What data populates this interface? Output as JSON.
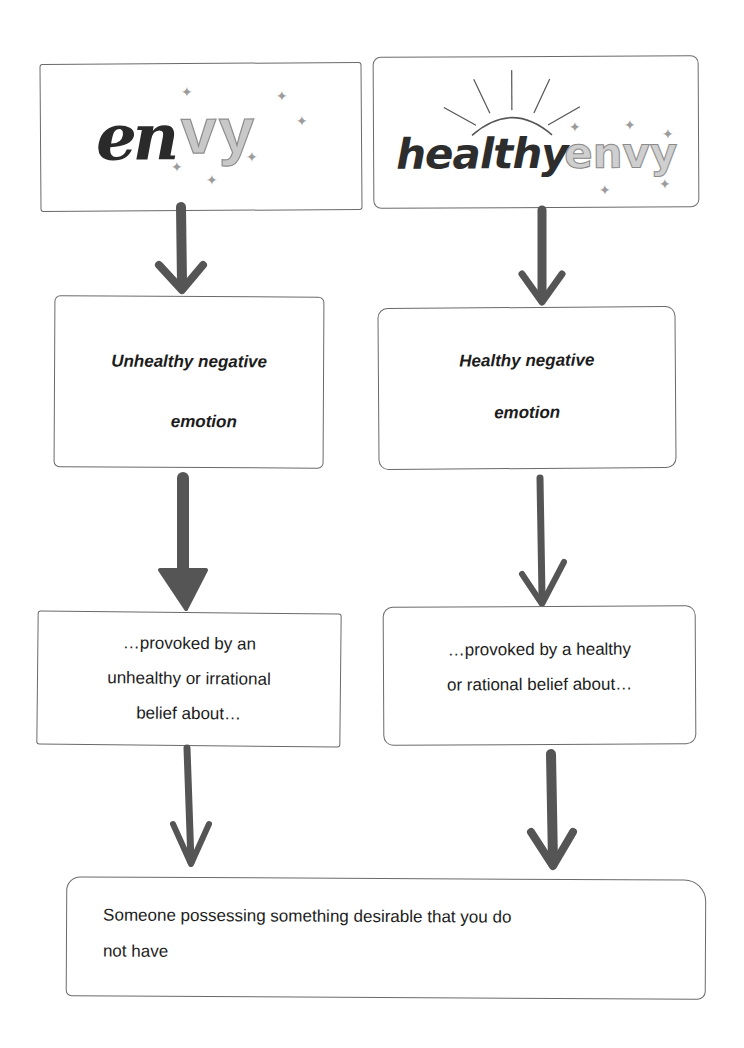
{
  "diagram": {
    "left_column": {
      "title_logo": {
        "part1": "en",
        "part2": "vy",
        "full": "envy"
      },
      "emotion": {
        "line1": "Unhealthy negative",
        "line2": "emotion"
      },
      "belief": {
        "line1": "…provoked by an",
        "line2": "unhealthy or irrational",
        "line3": "belief about…"
      }
    },
    "right_column": {
      "title_logo": {
        "part1": "healthy",
        "part2": "envy",
        "full": "healthy envy"
      },
      "emotion": {
        "line1": "Healthy negative",
        "line2": "emotion"
      },
      "belief": {
        "line1": "…provoked by a healthy",
        "line2": "or rational belief about…"
      }
    },
    "shared": {
      "line1": "Someone possessing something desirable that you do",
      "line2": "not have"
    },
    "icons": {
      "arrow": "arrow-down-icon",
      "sparkle": "sparkle-icon",
      "sun": "sun-rays-icon"
    },
    "colors": {
      "border": "#6a6a6a",
      "arrow": "#555555",
      "text": "#1c1c1c"
    }
  }
}
